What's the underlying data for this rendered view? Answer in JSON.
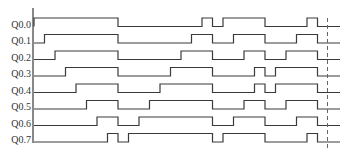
{
  "diagram": {
    "title": "",
    "type": "timing",
    "colors": {
      "signal": "#3a3a3a",
      "background": "#ffffff",
      "marker": "#666666"
    },
    "time_marker": "dashed end-of-cycle marker",
    "signals": [
      {
        "label": "Q0.0",
        "pulses": [
          [
            0,
            8
          ],
          [
            16,
            17
          ],
          [
            18,
            22
          ],
          [
            26,
            27
          ]
        ]
      },
      {
        "label": "Q0.1",
        "pulses": [
          [
            1,
            8
          ],
          [
            15,
            17
          ],
          [
            19,
            22
          ],
          [
            25,
            27
          ]
        ]
      },
      {
        "label": "Q0.2",
        "pulses": [
          [
            2,
            8
          ],
          [
            14,
            17
          ],
          [
            20,
            22
          ],
          [
            24,
            27
          ]
        ]
      },
      {
        "label": "Q0.3",
        "pulses": [
          [
            3,
            8
          ],
          [
            13,
            17
          ],
          [
            21,
            22
          ],
          [
            23,
            27
          ]
        ]
      },
      {
        "label": "Q0.4",
        "pulses": [
          [
            4,
            8
          ],
          [
            12,
            17
          ],
          [
            21,
            22
          ],
          [
            23,
            27
          ]
        ]
      },
      {
        "label": "Q0.5",
        "pulses": [
          [
            5,
            8
          ],
          [
            11,
            17
          ],
          [
            20,
            22
          ],
          [
            24,
            27
          ]
        ]
      },
      {
        "label": "Q0.6",
        "pulses": [
          [
            6,
            8
          ],
          [
            10,
            17
          ],
          [
            19,
            22
          ],
          [
            25,
            27
          ]
        ]
      },
      {
        "label": "Q0.7",
        "pulses": [
          [
            7,
            8
          ],
          [
            9,
            17
          ],
          [
            18,
            22
          ],
          [
            26,
            27
          ]
        ]
      }
    ],
    "time_range": [
      0,
      29.5
    ],
    "marker_time": 28
  }
}
